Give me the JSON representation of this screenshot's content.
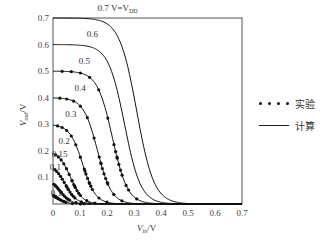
{
  "chart_data": {
    "type": "line",
    "title": "",
    "xlabel": "V_in/V",
    "ylabel": "V_out/V",
    "xlim": [
      0,
      0.7
    ],
    "ylim": [
      0,
      0.7
    ],
    "xticks": [
      "0",
      "0.1",
      "0.2",
      "0.3",
      "0.4",
      "0.5",
      "0.6",
      "0.7"
    ],
    "yticks": [
      "0",
      "0.1",
      "0.2",
      "0.3",
      "0.4",
      "0.5",
      "0.6",
      "0.7"
    ],
    "grid": false,
    "legend_position": "right",
    "legend": [
      {
        "marker": "dots",
        "label": "实验"
      },
      {
        "marker": "line",
        "label": "计算"
      }
    ],
    "series": [
      {
        "name": "0.7 V=V_DD",
        "vdd": 0.7,
        "vm": 0.31,
        "label": "0.7 V=V",
        "label_sub": "DD",
        "has_experimental": false
      },
      {
        "name": "0.6",
        "vdd": 0.6,
        "vm": 0.265,
        "label": "0.6",
        "has_experimental": false
      },
      {
        "name": "0.5",
        "vdd": 0.5,
        "vm": 0.22,
        "label": "0.5",
        "has_experimental": true
      },
      {
        "name": "0.4",
        "vdd": 0.4,
        "vm": 0.165,
        "label": "0.4",
        "has_experimental": true
      },
      {
        "name": "0.3",
        "vdd": 0.3,
        "vm": 0.11,
        "label": "0.3",
        "has_experimental": true
      },
      {
        "name": "0.2",
        "vdd": 0.2,
        "vm": 0.065,
        "label": "0.2",
        "has_experimental": true
      },
      {
        "name": "0.15",
        "vdd": 0.15,
        "vm": 0.045,
        "label": "0.15",
        "has_experimental": true
      },
      {
        "name": "0.1",
        "vdd": 0.1,
        "vm": 0.025,
        "label": "0.1",
        "has_experimental": true
      },
      {
        "name": "0.1 (lower)",
        "vdd": 0.05,
        "vm": 0.012,
        "label": "0.1",
        "has_experimental": true
      }
    ]
  },
  "legend": {
    "experimental": "实验",
    "calculated": "计算"
  },
  "axes": {
    "x_label_main": "V",
    "x_label_sub": "in",
    "x_label_unit": "/V",
    "y_label_main": "V",
    "y_label_sub": "out",
    "y_label_unit": "/V"
  }
}
